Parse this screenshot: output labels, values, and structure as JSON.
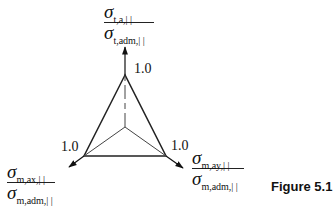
{
  "diagram": {
    "type": "triaxial-ratio-diagram",
    "axes": [
      {
        "id": "top",
        "numerator": {
          "symbol": "σ",
          "sub": "t,a,| |"
        },
        "denominator": {
          "symbol": "σ",
          "sub": "t,adm,| |"
        },
        "tick_value": "1.0"
      },
      {
        "id": "left",
        "numerator": {
          "symbol": "σ",
          "sub": "m,ax,| |"
        },
        "denominator": {
          "symbol": "σ",
          "sub": "m,adm,| |"
        },
        "tick_value": "1.0"
      },
      {
        "id": "right",
        "numerator": {
          "symbol": "σ",
          "sub": "m,ay,| |"
        },
        "denominator": {
          "symbol": "σ",
          "sub": "m,adm,| |"
        },
        "tick_value": "1.0"
      }
    ],
    "caption": "Figure 5.1",
    "colors": {
      "line": "#222222",
      "background": "#ffffff"
    }
  }
}
